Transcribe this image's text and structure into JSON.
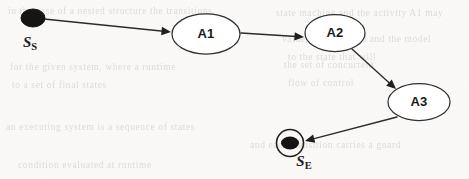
{
  "diagram": {
    "type": "state-machine",
    "background_color": "#fbfaf8",
    "stroke_color": "#2b2b2b",
    "node_fill_color": "#ffffff",
    "marker_color": "#151515"
  },
  "nodes": [
    {
      "id": "start",
      "kind": "initial-state",
      "label": "S",
      "label_subscript": "S",
      "label_full": "Ss",
      "cx": 33,
      "cy": 18,
      "r": 10.5,
      "label_x": 30,
      "label_y": 44
    },
    {
      "id": "a1",
      "kind": "activity",
      "label": "A1",
      "cx": 206,
      "cy": 34,
      "rx": 34,
      "ry": 20
    },
    {
      "id": "a2",
      "kind": "activity",
      "label": "A2",
      "cx": 335,
      "cy": 33,
      "rx": 30,
      "ry": 18.5
    },
    {
      "id": "a3",
      "kind": "activity",
      "label": "A3",
      "cx": 419,
      "cy": 102,
      "rx": 31,
      "ry": 18.5
    },
    {
      "id": "end",
      "kind": "final-state",
      "label": "S",
      "label_subscript": "E",
      "label_full": "SE",
      "cx": 290,
      "cy": 143,
      "r_outer": 13.5,
      "r_inner": 8,
      "label_x": 304,
      "label_y": 163
    }
  ],
  "edges": [
    {
      "id": "e1",
      "from": "start",
      "to": "a1",
      "x1": 44,
      "y1": 19,
      "x2": 171,
      "y2": 32,
      "arrow_angle": 6
    },
    {
      "id": "e2",
      "from": "a1",
      "to": "a2",
      "x1": 241,
      "y1": 33,
      "x2": 304,
      "y2": 37,
      "arrow_angle": 4
    },
    {
      "id": "e3",
      "from": "a2",
      "to": "a3",
      "x1": 352,
      "y1": 49,
      "x2": 396,
      "y2": 89,
      "arrow_angle": 42
    },
    {
      "id": "e4",
      "from": "a3",
      "to": "end",
      "x1": 397,
      "y1": 117,
      "x2": 305,
      "y2": 141,
      "arrow_angle": 195
    }
  ],
  "ghost_text_lines": [
    {
      "text": "in  the  case  of  a  nested  structure  the  transitions",
      "x": 8,
      "y": 12
    },
    {
      "text": "state  machine  and  the  activity  A1  may",
      "x": 276,
      "y": 14
    },
    {
      "text": "values  are  assigned  and  the  model",
      "x": 282,
      "y": 40
    },
    {
      "text": "to  the  state  that  will",
      "x": 288,
      "y": 58
    },
    {
      "text": "for  the  given  system,  where  a  runtime",
      "x": 10,
      "y": 68
    },
    {
      "text": "the  set  of  concurrent",
      "x": 284,
      "y": 66
    },
    {
      "text": "to  a  set  of  final  states",
      "x": 12,
      "y": 86
    },
    {
      "text": "flow  of  control",
      "x": 288,
      "y": 84
    },
    {
      "text": "an  executing  system  is  a  sequence  of  states",
      "x": 6,
      "y": 128
    },
    {
      "text": "and  each  transition  carries  a  guard",
      "x": 250,
      "y": 146
    },
    {
      "text": "condition  evaluated  at  runtime",
      "x": 18,
      "y": 166
    }
  ]
}
